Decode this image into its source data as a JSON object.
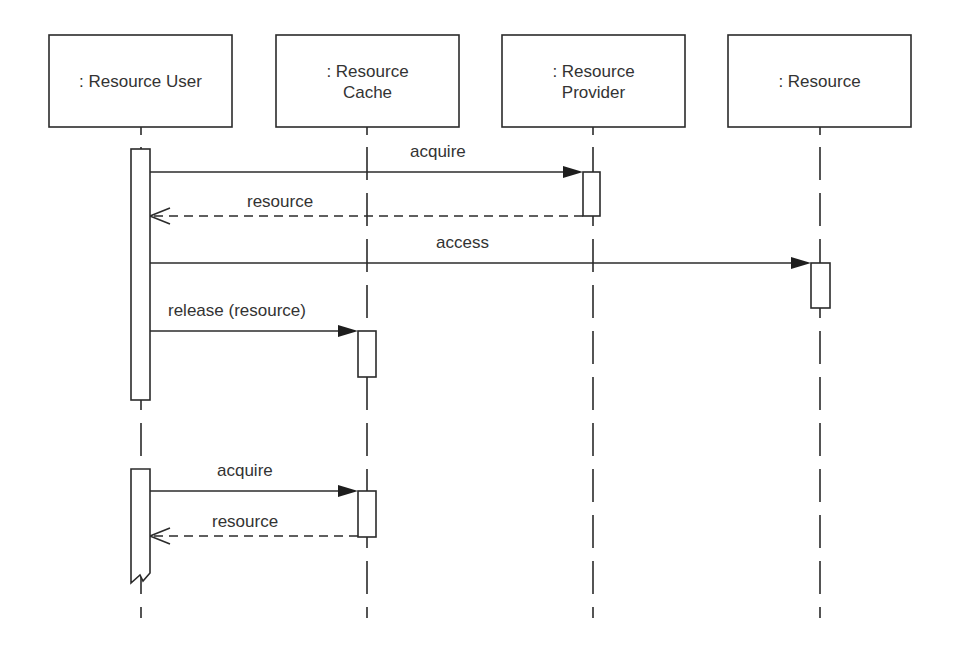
{
  "diagram": {
    "type": "UML sequence diagram",
    "colors": {
      "line": "#2b2b2b",
      "text": "#333333",
      "background": "#ffffff"
    },
    "participants": [
      {
        "id": "user",
        "lines": [
          ": Resource User"
        ],
        "x": 49,
        "w": 183,
        "lifeline_x": 141
      },
      {
        "id": "cache",
        "lines": [
          ": Resource",
          "Cache"
        ],
        "x": 276,
        "w": 183,
        "lifeline_x": 367
      },
      {
        "id": "provider",
        "lines": [
          ": Resource",
          "Provider"
        ],
        "x": 502,
        "w": 183,
        "lifeline_x": 593
      },
      {
        "id": "resource",
        "lines": [
          ": Resource"
        ],
        "x": 728,
        "w": 183,
        "lifeline_x": 820
      }
    ],
    "box_top": 35,
    "box_height": 92,
    "lifeline_end": 618,
    "activations": [
      {
        "participant": "user",
        "x": 131,
        "y": 149,
        "w": 19,
        "h": 251
      },
      {
        "participant": "provider",
        "x": 583,
        "y": 172,
        "w": 17,
        "h": 44
      },
      {
        "participant": "resource",
        "x": 811,
        "y": 263,
        "w": 19,
        "h": 45
      },
      {
        "participant": "cache",
        "x": 358,
        "y": 331,
        "w": 18,
        "h": 46
      },
      {
        "participant": "user",
        "x": 131,
        "y": 469,
        "w": 19,
        "h": 114,
        "broken_end": true
      },
      {
        "participant": "cache",
        "x": 358,
        "y": 491,
        "w": 18,
        "h": 46
      }
    ],
    "messages": [
      {
        "label": "acquire",
        "from": "user",
        "to": "provider",
        "kind": "sync",
        "x1": 150,
        "x2": 583,
        "y": 172,
        "label_x": 410,
        "label_y": 157
      },
      {
        "label": "resource",
        "from": "provider",
        "to": "user",
        "kind": "return",
        "x1": 583,
        "x2": 150,
        "y": 216,
        "label_x": 247,
        "label_y": 207
      },
      {
        "label": "access",
        "from": "user",
        "to": "resource",
        "kind": "sync",
        "x1": 150,
        "x2": 811,
        "y": 263,
        "label_x": 436,
        "label_y": 248
      },
      {
        "label": "release (resource)",
        "from": "user",
        "to": "cache",
        "kind": "sync",
        "x1": 150,
        "x2": 358,
        "y": 331,
        "label_x": 168,
        "label_y": 316
      },
      {
        "label": "acquire",
        "from": "user",
        "to": "cache",
        "kind": "sync",
        "x1": 150,
        "x2": 358,
        "y": 491,
        "label_x": 217,
        "label_y": 476
      },
      {
        "label": "resource",
        "from": "cache",
        "to": "user",
        "kind": "return",
        "x1": 358,
        "x2": 150,
        "y": 536,
        "label_x": 212,
        "label_y": 527
      }
    ]
  }
}
